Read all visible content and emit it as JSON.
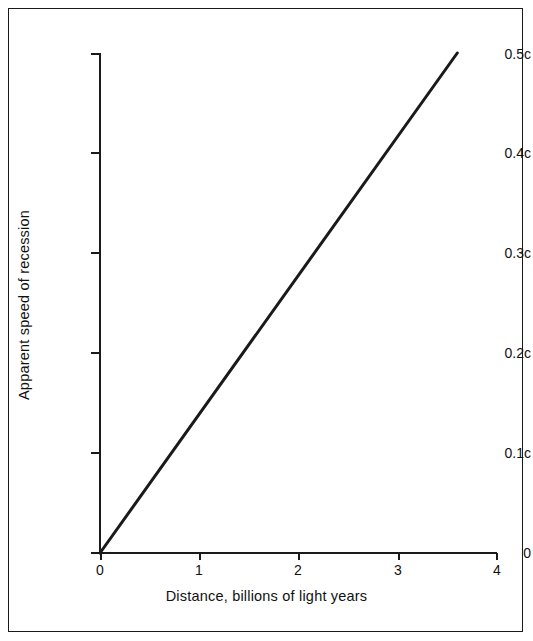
{
  "figure": {
    "background_color": "#ffffff",
    "border_color": "#1a1a1a",
    "line_color": "#1a1a1a"
  },
  "chart_data": {
    "type": "line",
    "title": "",
    "subtitle": "",
    "xlabel": "Distance, billions of light years",
    "ylabel": "Apparent speed of recession",
    "xlim": [
      0,
      4
    ],
    "ylim": [
      0,
      0.5
    ],
    "grid": false,
    "legend": "none",
    "x_ticks": [
      0,
      1,
      2,
      3,
      4
    ],
    "x_tick_labels": [
      "0",
      "1",
      "2",
      "3",
      "4"
    ],
    "y_ticks": [
      0,
      0.1,
      0.2,
      0.3,
      0.4,
      0.5
    ],
    "y_tick_labels": [
      "0",
      "0.1c",
      "0.2c",
      "0.3c",
      "0.4c",
      "0.5c"
    ],
    "series": [
      {
        "name": "Hubble relation",
        "x": [
          0,
          3.6
        ],
        "values": [
          0,
          0.5
        ],
        "slope_per_billion_ly": 0.139,
        "style": "solid",
        "width_px": 3,
        "color": "#1a1a1a"
      }
    ],
    "annotations": []
  }
}
